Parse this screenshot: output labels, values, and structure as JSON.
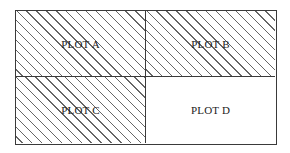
{
  "diagram": {
    "type": "2x2 plot layout",
    "plots": [
      {
        "label": "PLOT A",
        "position": "top-left",
        "hatched": true
      },
      {
        "label": "PLOT B",
        "position": "top-right",
        "hatched": true
      },
      {
        "label": "PLOT C",
        "position": "bottom-left",
        "hatched": true
      },
      {
        "label": "PLOT D",
        "position": "bottom-right",
        "hatched": false
      }
    ],
    "colors": {
      "line": "#3a3a3a",
      "hatch": "#666666",
      "background": "#ffffff"
    }
  }
}
